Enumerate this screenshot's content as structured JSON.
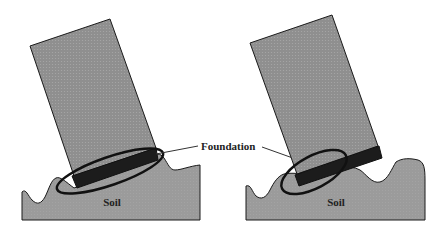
{
  "diagram": {
    "labels": {
      "foundation": "Foundation",
      "soil_left": "Soil",
      "soil_right": "Soil"
    },
    "colors": {
      "building_fill": "#8f8f8f",
      "soil_fill": "#9a9a9a",
      "foundation_fill": "#1c1c1c",
      "outline": "#1a1a1a",
      "background": "#ffffff"
    },
    "panels": [
      {
        "id": "left",
        "description": "Tilted building on soil with foundation highlighted by ellipse"
      },
      {
        "id": "right",
        "description": "Tilted building on undulating soil with foundation highlighted by ellipse"
      }
    ]
  }
}
